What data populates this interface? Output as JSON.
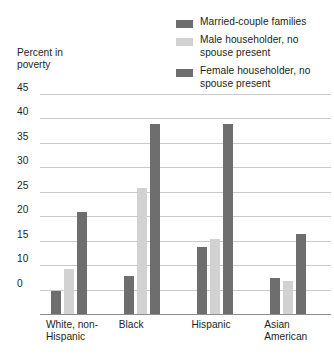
{
  "chart_data": {
    "type": "bar",
    "title": "",
    "subtitle": "",
    "xlabel": "",
    "ylabel": "Percent in poverty",
    "ylim": [
      0,
      45
    ],
    "ytick_values": [
      45,
      40,
      35,
      30,
      25,
      20,
      15,
      10,
      0
    ],
    "ytick_labels": [
      "45",
      "40",
      "35",
      "30",
      "25",
      "20",
      "15",
      "10",
      "0"
    ],
    "grid": true,
    "legend_position": "top-right",
    "categories": [
      "White, non-Hispanic",
      "Black",
      "Hispanic",
      "Asian American"
    ],
    "series": [
      {
        "name": "Married-couple families",
        "color": "#6e6e6e",
        "values": [
          5,
          8,
          14,
          7.5
        ]
      },
      {
        "name": "Male householder, no spouse present",
        "color": "#d2d2d2",
        "values": [
          9.5,
          26,
          15.5,
          7
        ]
      },
      {
        "name": "Female householder, no spouse present",
        "color": "#6e6e6e",
        "values": [
          21,
          39,
          39,
          16.5
        ]
      }
    ]
  },
  "legend": {
    "items": [
      {
        "label": "Married-couple families",
        "color": "#6e6e6e"
      },
      {
        "label": "Male householder, no spouse present",
        "color": "#d2d2d2"
      },
      {
        "label": "Female householder, no spouse present",
        "color": "#6e6e6e"
      }
    ]
  },
  "axis": {
    "y_title": "Percent in poverty",
    "ticks": [
      "45",
      "40",
      "35",
      "30",
      "25",
      "20",
      "15",
      "10",
      "0"
    ]
  },
  "categories": [
    {
      "line1": "White, non-",
      "line2": "Hispanic"
    },
    {
      "line1": "Black",
      "line2": ""
    },
    {
      "line1": "Hispanic",
      "line2": ""
    },
    {
      "line1": "Asian",
      "line2": "American"
    }
  ],
  "colors": {
    "bar_dark": "#6e6e6e",
    "bar_light": "#d2d2d2",
    "gridline": "#c9c9c9",
    "baseline": "#8d8d8d",
    "text": "#231f20",
    "background": "#ffffff"
  }
}
